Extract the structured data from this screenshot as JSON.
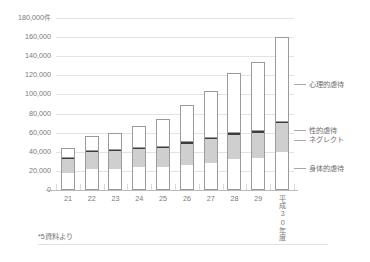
{
  "chart_data": {
    "type": "bar",
    "subtype": "stacked-column",
    "title": "",
    "xlabel": "",
    "ylabel": "",
    "unit_label": "件",
    "ylim": [
      0,
      180000
    ],
    "ytick_step": 20000,
    "yticks": [
      {
        "value": 180000,
        "label": "180,000",
        "unit": "件"
      },
      {
        "value": 160000,
        "label": "160,000",
        "unit": ""
      },
      {
        "value": 140000,
        "label": "140,000",
        "unit": ""
      },
      {
        "value": 120000,
        "label": "120,000",
        "unit": ""
      },
      {
        "value": 100000,
        "label": "100,000",
        "unit": ""
      },
      {
        "value": 80000,
        "label": "80,000",
        "unit": ""
      },
      {
        "value": 60000,
        "label": "60,000",
        "unit": ""
      },
      {
        "value": 40000,
        "label": "40,000",
        "unit": ""
      },
      {
        "value": 20000,
        "label": "20,000",
        "unit": ""
      },
      {
        "value": 0,
        "label": "0",
        "unit": ""
      }
    ],
    "grid": true,
    "legend_position": "right",
    "categories": [
      "21",
      "22",
      "23",
      "24",
      "25",
      "26",
      "27",
      "28",
      "29",
      "平成30年度"
    ],
    "categories_vertical": [
      false,
      false,
      false,
      false,
      false,
      false,
      false,
      false,
      false,
      true
    ],
    "series": [
      {
        "name": "身体的虐待",
        "color": "#ffffff",
        "values": [
          17371,
          21559,
          21942,
          23579,
          24245,
          26181,
          28621,
          31925,
          33223,
          40238
        ]
      },
      {
        "name": "ネグレクト",
        "color": "#cfcfcf",
        "values": [
          15185,
          18352,
          18847,
          19250,
          19627,
          22455,
          24444,
          25842,
          26821,
          29479
        ]
      },
      {
        "name": "性的虐待",
        "color": "#3d3d3d",
        "values": [
          1350,
          1405,
          1460,
          1449,
          1582,
          1520,
          1521,
          1622,
          1537,
          1730
        ]
      },
      {
        "name": "心理的虐待",
        "color": "#ffffff",
        "values": [
          10305,
          15068,
          17670,
          22423,
          28348,
          38775,
          48700,
          63186,
          72197,
          88391
        ]
      }
    ],
    "totals": [
      44211,
      56384,
      59919,
      66701,
      73802,
      88931,
      103286,
      122575,
      133778,
      159838
    ],
    "legend_entries": [
      {
        "label": "心理的虐待",
        "anchor_value": 110000
      },
      {
        "label": "性的虐待",
        "anchor_value": 62000
      },
      {
        "label": "ネグレクト",
        "anchor_value": 52000
      },
      {
        "label": "身体的虐待",
        "anchor_value": 22000
      }
    ]
  },
  "footer": {
    "note": "*5資料より"
  }
}
